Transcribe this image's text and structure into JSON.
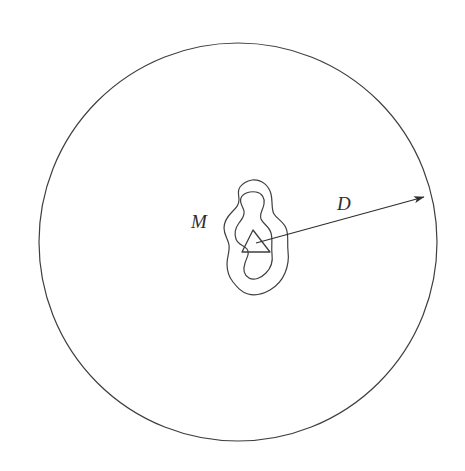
{
  "diagram": {
    "background_color": "#ffffff",
    "stroke_color": "#3f3f3f",
    "labels": {
      "mass_label": "M",
      "distance_label": "D"
    },
    "shapes": {
      "outer_circle": {
        "name": "sphere-boundary",
        "center_x": 238,
        "center_y": 242,
        "radius": 199,
        "stroke_width": 1.2
      },
      "outer_blob": {
        "name": "mass-outer-contour",
        "stroke_width": 1.2,
        "bbox": [
          224,
          180,
          288,
          296
        ]
      },
      "inner_blob": {
        "name": "mass-inner-contour",
        "stroke_width": 1.2,
        "bbox": [
          234,
          192,
          272,
          283
        ]
      },
      "triangle": {
        "name": "mass-center-triangle",
        "stroke_width": 1.3,
        "points": "253,230 242,252 270,252"
      },
      "radius_arrow": {
        "name": "distance-arrow",
        "stroke_width": 1.2,
        "start_x": 256,
        "start_y": 243,
        "end_x": 429,
        "end_y": 195
      }
    },
    "label_positions": {
      "mass_label_x": 191,
      "mass_label_y": 228,
      "mass_label_size": 19,
      "distance_label_x": 337,
      "distance_label_y": 210,
      "distance_label_size": 19
    }
  }
}
